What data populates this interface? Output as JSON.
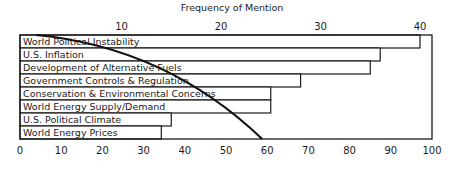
{
  "chart_data": {
    "type": "bar",
    "orientation": "horizontal",
    "title": "Frequency of Mention",
    "top_axis": {
      "label": "Frequency of Mention",
      "ticks": [
        10,
        20,
        30,
        40
      ],
      "range": [
        0,
        42
      ]
    },
    "bottom_axis": {
      "label": "",
      "ticks": [
        0,
        10,
        20,
        30,
        40,
        50,
        60,
        70,
        80,
        90,
        100
      ],
      "range": [
        0,
        100
      ]
    },
    "categories": [
      "World Political Instability",
      "U.S. Inflation",
      "Development of Alternative Fuels",
      "Government Controls & Regulation",
      "Conservation & Environmental Concerns",
      "World Energy Supply/Demand",
      "U.S. Political Climate",
      "World Energy Prices"
    ],
    "series": [
      {
        "name": "Frequency of Mention",
        "axis": "top",
        "values": [
          40,
          36,
          35,
          28,
          25,
          25,
          15,
          14
        ]
      }
    ],
    "cumulative_curve": {
      "description": "Curved line descending from upper-left to bottom axis near 60",
      "points": [
        [
          5,
          0
        ],
        [
          20,
          1.5
        ],
        [
          35,
          3.5
        ],
        [
          45,
          4.5
        ],
        [
          52,
          5.5
        ],
        [
          57,
          6.5
        ],
        [
          60,
          8
        ]
      ]
    },
    "grid": false,
    "legend": null
  }
}
